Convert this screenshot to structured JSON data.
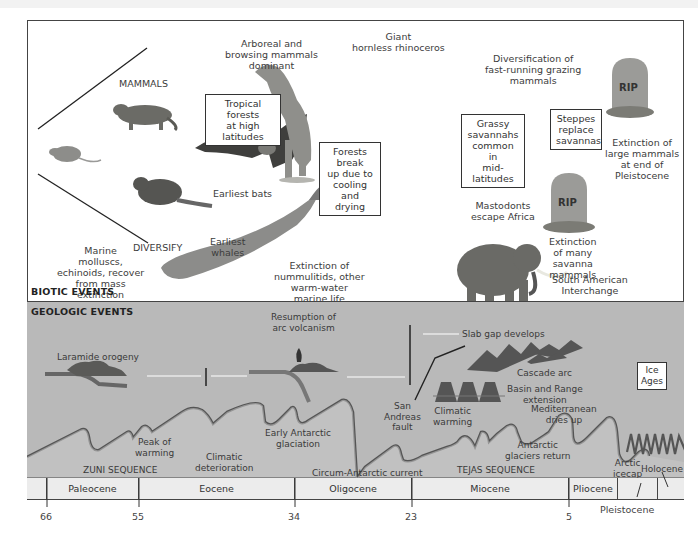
{
  "biotic": {
    "section_title": "BIOTIC EVENTS",
    "labels": {
      "mammals": "MAMMALS",
      "diversify": "DIVERSIFY",
      "arboreal": [
        "Arboreal and",
        "browsing mammals",
        "dominant"
      ],
      "rhino": [
        "Giant",
        "hornless rhinoceros"
      ],
      "grazing": [
        "Diversification of",
        "fast-running grazing",
        "mammals"
      ],
      "marine": [
        "Marine",
        "molluscs,",
        "echinoids, recover",
        "from mass",
        "extinction"
      ],
      "earliest_bats": "Earliest bats",
      "earliest_whales": [
        "Earliest",
        "whales"
      ],
      "nummulitids": [
        "Extinction of",
        "nummulitids, other",
        "warm-water",
        "marine life"
      ],
      "mastodonts": [
        "Mastodonts",
        "escape Africa"
      ],
      "extinction_savanna": [
        "Extinction",
        "of many",
        "savanna",
        "mammals"
      ],
      "south_american": [
        "South American",
        "Interchange"
      ],
      "extinction_large": [
        "Extinction of",
        "large mammals",
        "at end of",
        "Pleistocene"
      ],
      "rip1": "RIP",
      "rip2": "RIP"
    },
    "boxes": {
      "tropical": [
        "Tropical forests",
        "at high latitudes"
      ],
      "forests_break": [
        "Forests break",
        "up due to",
        "cooling and",
        "drying"
      ],
      "grassy": [
        "Grassy",
        "savannahs",
        "common in",
        "mid-latitudes"
      ],
      "steppes": [
        "Steppes",
        "replace",
        "savannas"
      ]
    }
  },
  "geologic": {
    "section_title": "GEOLOGIC EVENTS",
    "labels": {
      "laramide": "Laramide orogeny",
      "arc_volcanism": [
        "Resumption of",
        "arc volcanism"
      ],
      "slab_gap": "Slab gap develops",
      "cascade": "Cascade arc",
      "basin_range": [
        "Basin and Range",
        "extension"
      ],
      "san_andreas": [
        "San",
        "Andreas",
        "fault"
      ],
      "climatic_warming": [
        "Climatic",
        "warming"
      ],
      "mediterranean": [
        "Mediterranean",
        "dries up"
      ],
      "peak_warming": [
        "Peak of",
        "warming"
      ],
      "climatic_deterioration": [
        "Climatic",
        "deterioration"
      ],
      "early_antarctic": [
        "Early Antarctic",
        "glaciation"
      ],
      "antarctic_return": [
        "Antarctic",
        "glaciers return"
      ],
      "arctic_icecap": [
        "Arctic",
        "icecap"
      ],
      "zuni": "ZUNI SEQUENCE",
      "tejas": "TEJAS SEQUENCE",
      "circum": "Circum-Antarctic current",
      "holocene": "Holocene"
    },
    "boxes": {
      "ice_ages": [
        "Ice",
        "Ages"
      ]
    }
  },
  "timeline": {
    "epochs": [
      "Paleocene",
      "Eocene",
      "Oligocene",
      "Miocene",
      "Pliocene",
      "",
      ""
    ],
    "ticks": [
      "66",
      "55",
      "34",
      "23",
      "5"
    ],
    "pleistocene": "Pleistocene"
  }
}
